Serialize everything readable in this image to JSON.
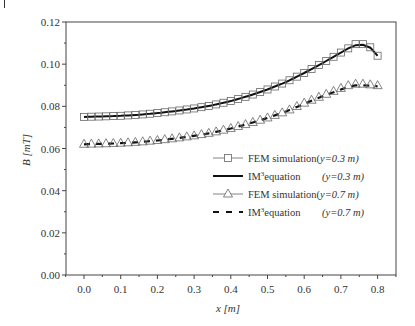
{
  "chart_data": {
    "type": "line",
    "title": "",
    "xlabel": "x [m]",
    "ylabel": "B [mT]",
    "xlim": [
      -0.05,
      0.85
    ],
    "ylim": [
      0.0,
      0.12
    ],
    "x_ticks": [
      "0.0",
      "0.1",
      "0.2",
      "0.3",
      "0.4",
      "0.5",
      "0.6",
      "0.7",
      "0.8"
    ],
    "y_ticks": [
      "0.00",
      "0.02",
      "0.04",
      "0.06",
      "0.08",
      "0.10",
      "0.12"
    ],
    "grid": false,
    "legend_position": "center-right",
    "x": [
      0.0,
      0.05,
      0.1,
      0.15,
      0.2,
      0.25,
      0.3,
      0.35,
      0.4,
      0.45,
      0.5,
      0.55,
      0.6,
      0.65,
      0.7,
      0.72,
      0.74,
      0.76,
      0.78,
      0.8
    ],
    "series": [
      {
        "name": "FEM simulation(y=0.3 m)",
        "style": "square-marker",
        "values": [
          0.075,
          0.0752,
          0.0755,
          0.076,
          0.0768,
          0.0778,
          0.079,
          0.0805,
          0.0825,
          0.085,
          0.088,
          0.0915,
          0.0958,
          0.1005,
          0.1055,
          0.1075,
          0.1095,
          0.1095,
          0.108,
          0.104
        ]
      },
      {
        "name": "IM3 equation (y=0.3 m)",
        "style": "solid-line",
        "values": [
          0.075,
          0.0752,
          0.0755,
          0.076,
          0.0768,
          0.0778,
          0.079,
          0.0805,
          0.0825,
          0.085,
          0.088,
          0.0915,
          0.0958,
          0.1005,
          0.1055,
          0.1075,
          0.109,
          0.1092,
          0.1078,
          0.104
        ]
      },
      {
        "name": "FEM simulation(y=0.7 m)",
        "style": "triangle-marker",
        "values": [
          0.062,
          0.0622,
          0.0625,
          0.063,
          0.0638,
          0.0648,
          0.066,
          0.0675,
          0.0695,
          0.0718,
          0.0745,
          0.0775,
          0.0815,
          0.085,
          0.0885,
          0.0898,
          0.0905,
          0.0905,
          0.0902,
          0.0898
        ]
      },
      {
        "name": "IM3 equation (y=0.7 m)",
        "style": "dashed-line",
        "values": [
          0.062,
          0.0622,
          0.0625,
          0.063,
          0.0638,
          0.0648,
          0.066,
          0.0675,
          0.0695,
          0.0718,
          0.0745,
          0.0775,
          0.0812,
          0.0848,
          0.088,
          0.0892,
          0.09,
          0.09,
          0.0898,
          0.0895
        ]
      }
    ]
  },
  "legend": {
    "items": [
      {
        "label_a": "FEM simulation(",
        "label_b": "y=0.3 m)",
        "marker": "square"
      },
      {
        "label_a": "IM",
        "sup": "3",
        "label_mid": "equation",
        "label_b": "(y=0.3 m)",
        "marker": "solid"
      },
      {
        "label_a": "FEM simulation(",
        "label_b": "y=0.7 m)",
        "marker": "triangle"
      },
      {
        "label_a": "IM",
        "sup": "3",
        "label_mid": "equation",
        "label_b": "(y=0.7 m)",
        "marker": "dashed"
      }
    ]
  },
  "axes": {
    "x_title": "x [m]",
    "y_title": "B [mT]"
  }
}
